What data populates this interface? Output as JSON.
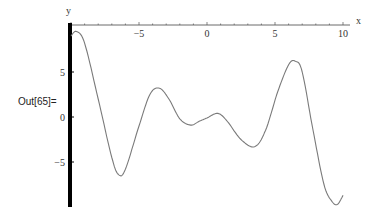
{
  "cell": {
    "output_label": "Out[65]="
  },
  "chart_data": {
    "type": "line",
    "title": "",
    "xlabel": "x",
    "ylabel": "y",
    "xlim": [
      -10,
      10
    ],
    "ylim": [
      -10,
      10
    ],
    "grid": false,
    "legend": null,
    "x_ticks": [
      -5,
      0,
      5,
      10
    ],
    "x_tick_labels": [
      "−5",
      "0",
      "5",
      "10"
    ],
    "y_ticks": [
      5,
      0,
      -5
    ],
    "y_tick_labels": [
      "5",
      "0",
      "−5"
    ],
    "axes_origin": [
      -10,
      10
    ],
    "line_color": "#7a7a7a",
    "axis_color": "#000000",
    "series": [
      {
        "name": "f(x)",
        "x": [
          -10,
          -9.6,
          -9.0,
          -8.0,
          -7.0,
          -6.5,
          -6.0,
          -5.0,
          -4.2,
          -3.5,
          -2.8,
          -2.0,
          -1.2,
          -0.6,
          0.0,
          0.8,
          1.5,
          2.5,
          3.5,
          4.3,
          5.2,
          6.0,
          6.5,
          7.0,
          7.8,
          8.6,
          9.2,
          9.6,
          10.0
        ],
        "y": [
          9.0,
          9.5,
          8.2,
          2.0,
          -4.5,
          -6.4,
          -5.8,
          -1.0,
          2.5,
          3.2,
          2.0,
          -0.2,
          -0.9,
          -0.5,
          -0.1,
          0.4,
          -0.5,
          -2.5,
          -3.3,
          -1.5,
          2.8,
          5.8,
          6.2,
          5.0,
          -1.5,
          -7.5,
          -9.4,
          -9.7,
          -8.7
        ]
      }
    ]
  }
}
